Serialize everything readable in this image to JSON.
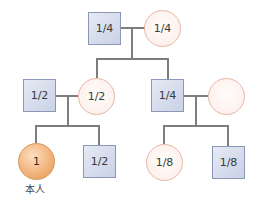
{
  "diagram": {
    "type": "pedigree",
    "colors": {
      "male_fill": "#d3d9eb",
      "male_border": "#8b97b6",
      "female_fill": "#fdf1ec",
      "female_border": "#e7b7a6",
      "self_fill": "#f2b47c",
      "line": "#7d7d7d"
    },
    "nodes": {
      "grandfather": {
        "shape": "square",
        "value": "1/4"
      },
      "grandmother": {
        "shape": "circle",
        "value": "1/4"
      },
      "father": {
        "shape": "square",
        "value": "1/2"
      },
      "mother": {
        "shape": "circle",
        "value": "1/2"
      },
      "uncle": {
        "shape": "square",
        "value": "1/4"
      },
      "aunt_in_law": {
        "shape": "circle",
        "value": ""
      },
      "self": {
        "shape": "circle",
        "value": "1",
        "label": "本人"
      },
      "brother": {
        "shape": "square",
        "value": "1/2"
      },
      "cousin_female": {
        "shape": "circle",
        "value": "1/8"
      },
      "cousin_male": {
        "shape": "square",
        "value": "1/8"
      }
    }
  }
}
